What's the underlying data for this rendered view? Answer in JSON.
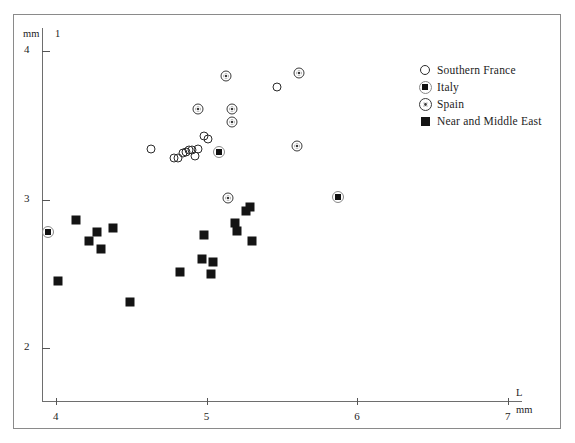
{
  "figure": {
    "panel_number": "1",
    "y_unit_label": "mm",
    "x_unit_label": "mm",
    "x_axis_name": "L",
    "y_axis_name": "1"
  },
  "legend": {
    "entries": [
      {
        "label": "Southern France",
        "marker": "open-circle",
        "key": "sf"
      },
      {
        "label": "Italy",
        "marker": "square-in-circle",
        "key": "it"
      },
      {
        "label": "Spain",
        "marker": "circle-in-circle",
        "key": "sp"
      },
      {
        "label": "Near and Middle East",
        "marker": "filled-square",
        "key": "nme"
      }
    ]
  },
  "chart_data": {
    "type": "scatter",
    "title": "",
    "xlabel": "L",
    "ylabel": "1",
    "x_unit": "mm",
    "y_unit": "mm",
    "xlim": [
      3.9,
      7.1
    ],
    "ylim": [
      1.9,
      4.15
    ],
    "xticks": [
      4,
      5,
      6,
      7
    ],
    "yticks": [
      2,
      3,
      4
    ],
    "grid": false,
    "legend_position": "top-right",
    "series": [
      {
        "name": "Southern France",
        "marker": "open-circle",
        "points": [
          [
            4.63,
            3.34
          ],
          [
            4.78,
            3.28
          ],
          [
            4.81,
            3.28
          ],
          [
            4.84,
            3.31
          ],
          [
            4.86,
            3.32
          ],
          [
            4.88,
            3.33
          ],
          [
            4.9,
            3.33
          ],
          [
            4.92,
            3.29
          ],
          [
            4.94,
            3.34
          ],
          [
            4.98,
            3.43
          ],
          [
            5.01,
            3.41
          ],
          [
            5.47,
            3.76
          ]
        ]
      },
      {
        "name": "Italy",
        "marker": "square-in-circle",
        "points": [
          [
            3.95,
            2.78
          ],
          [
            5.08,
            3.32
          ],
          [
            5.87,
            3.02
          ]
        ]
      },
      {
        "name": "Spain",
        "marker": "circle-in-circle",
        "points": [
          [
            5.13,
            3.83
          ],
          [
            5.61,
            3.85
          ],
          [
            4.94,
            3.61
          ],
          [
            5.17,
            3.61
          ],
          [
            5.17,
            3.52
          ],
          [
            5.6,
            3.36
          ],
          [
            5.14,
            3.01
          ]
        ]
      },
      {
        "name": "Near and Middle East",
        "marker": "filled-square",
        "points": [
          [
            4.13,
            2.86
          ],
          [
            4.22,
            2.72
          ],
          [
            4.27,
            2.78
          ],
          [
            4.3,
            2.67
          ],
          [
            4.38,
            2.81
          ],
          [
            4.01,
            2.45
          ],
          [
            4.49,
            2.31
          ],
          [
            4.82,
            2.51
          ],
          [
            4.98,
            2.76
          ],
          [
            4.97,
            2.6
          ],
          [
            5.04,
            2.58
          ],
          [
            5.03,
            2.5
          ],
          [
            5.19,
            2.84
          ],
          [
            5.2,
            2.79
          ],
          [
            5.26,
            2.92
          ],
          [
            5.29,
            2.95
          ],
          [
            5.3,
            2.72
          ]
        ]
      }
    ]
  }
}
